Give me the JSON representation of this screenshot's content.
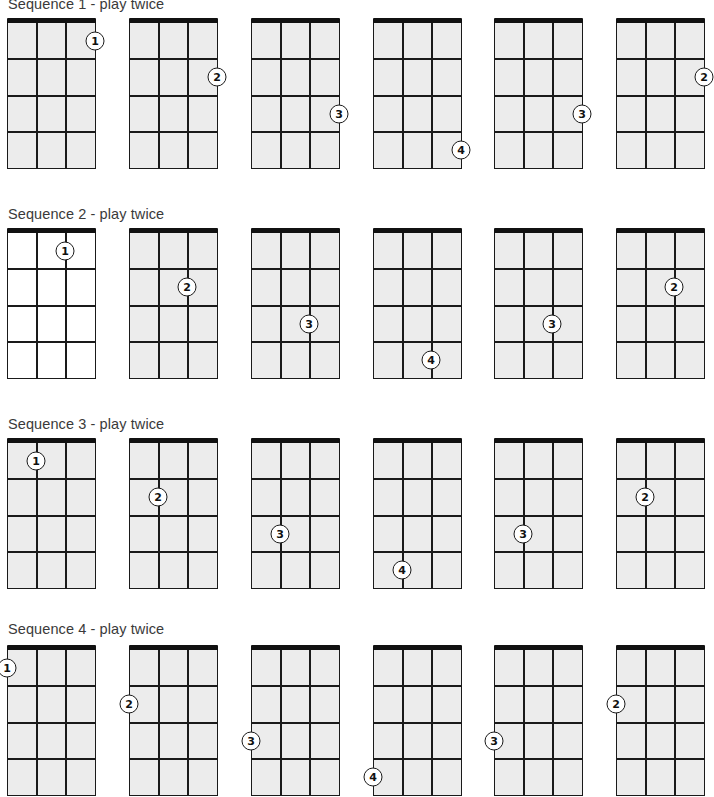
{
  "colors": {
    "fretboard_fill": "#ececec",
    "line": "#1a1a1a",
    "nut": "#111111",
    "finger_dot_fill": "#ffffff"
  },
  "diagram_spec": {
    "instrument": "ukulele",
    "strings": 4,
    "frets_shown": 4,
    "string_numbering": "1 = leftmost, 4 = rightmost"
  },
  "sequences": [
    {
      "label": "Sequence 1 - play twice",
      "string": 4,
      "charts": [
        {
          "finger": "1",
          "fret": 1,
          "fill": "grey"
        },
        {
          "finger": "2",
          "fret": 2,
          "fill": "grey"
        },
        {
          "finger": "3",
          "fret": 3,
          "fill": "grey"
        },
        {
          "finger": "4",
          "fret": 4,
          "fill": "grey"
        },
        {
          "finger": "3",
          "fret": 3,
          "fill": "grey"
        },
        {
          "finger": "2",
          "fret": 2,
          "fill": "grey"
        }
      ]
    },
    {
      "label": "Sequence 2 - play twice",
      "string": 3,
      "charts": [
        {
          "finger": "1",
          "fret": 1,
          "fill": "white"
        },
        {
          "finger": "2",
          "fret": 2,
          "fill": "grey"
        },
        {
          "finger": "3",
          "fret": 3,
          "fill": "grey"
        },
        {
          "finger": "4",
          "fret": 4,
          "fill": "grey"
        },
        {
          "finger": "3",
          "fret": 3,
          "fill": "grey"
        },
        {
          "finger": "2",
          "fret": 2,
          "fill": "grey"
        }
      ]
    },
    {
      "label": "Sequence 3 - play twice",
      "string": 2,
      "charts": [
        {
          "finger": "1",
          "fret": 1,
          "fill": "grey"
        },
        {
          "finger": "2",
          "fret": 2,
          "fill": "grey"
        },
        {
          "finger": "3",
          "fret": 3,
          "fill": "grey"
        },
        {
          "finger": "4",
          "fret": 4,
          "fill": "grey"
        },
        {
          "finger": "3",
          "fret": 3,
          "fill": "grey"
        },
        {
          "finger": "2",
          "fret": 2,
          "fill": "grey"
        }
      ]
    },
    {
      "label": "Sequence 4 - play twice",
      "string": 1,
      "charts": [
        {
          "finger": "1",
          "fret": 1,
          "fill": "grey"
        },
        {
          "finger": "2",
          "fret": 2,
          "fill": "grey"
        },
        {
          "finger": "3",
          "fret": 3,
          "fill": "grey"
        },
        {
          "finger": "4",
          "fret": 4,
          "fill": "grey"
        },
        {
          "finger": "3",
          "fret": 3,
          "fill": "grey"
        },
        {
          "finger": "2",
          "fret": 2,
          "fill": "grey"
        }
      ]
    }
  ]
}
